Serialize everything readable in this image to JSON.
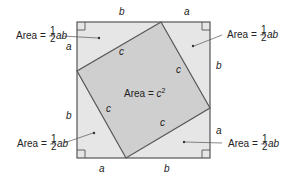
{
  "diagram": {
    "outer_square": {
      "side_labels": [
        "a",
        "b"
      ]
    },
    "inner_square": {
      "side_label": "c",
      "area_label_prefix": "Area = ",
      "area_label_var": "c",
      "area_label_exp": "2"
    },
    "triangle_area": {
      "prefix": "Area = ",
      "frac_num": "1",
      "frac_den": "2",
      "suffix": "ab"
    },
    "edge_labels": {
      "top_left": "b",
      "top_right": "a",
      "right_top": "b",
      "right_bottom": "a",
      "bottom_left": "a",
      "bottom_right": "b",
      "left_top": "a",
      "left_bottom": "b"
    },
    "colors": {
      "outer_fill": "#e6e6e6",
      "inner_fill": "#cfcfcf",
      "stroke": "#555555",
      "text": "#222222"
    }
  }
}
